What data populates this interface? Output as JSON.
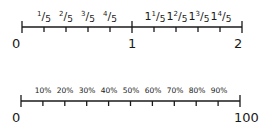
{
  "number_lines": [
    {
      "name": "fractions",
      "start_label": "0",
      "mid_label": "1",
      "end_label": "2",
      "tick_labels": [
        {
          "whole": "",
          "num": "1",
          "den": "5"
        },
        {
          "whole": "",
          "num": "2",
          "den": "5"
        },
        {
          "whole": "",
          "num": "3",
          "den": "5"
        },
        {
          "whole": "",
          "num": "4",
          "den": "5"
        },
        {
          "whole": "1",
          "num": "1",
          "den": "5"
        },
        {
          "whole": "1",
          "num": "2",
          "den": "5"
        },
        {
          "whole": "1",
          "num": "3",
          "den": "5"
        },
        {
          "whole": "1",
          "num": "4",
          "den": "5"
        }
      ]
    },
    {
      "name": "percentages",
      "start_label": "0",
      "end_label": "100",
      "tick_labels": [
        "10%",
        "20%",
        "30%",
        "40%",
        "50%",
        "60%",
        "70%",
        "80%",
        "90%"
      ]
    }
  ],
  "colors": {
    "line": "#1a1a1a",
    "background": "#ffffff"
  }
}
